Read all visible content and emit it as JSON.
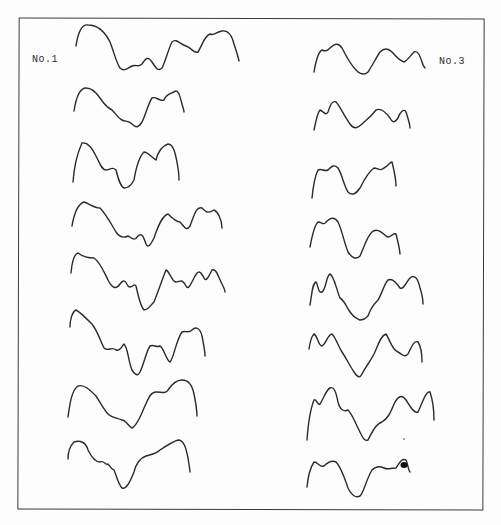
{
  "figure": {
    "columns": [
      {
        "label": "No.1",
        "trace_count": 8
      },
      {
        "label": "No.3",
        "trace_count": 8
      }
    ],
    "stroke_color": "#2b2b2b",
    "background_color": "#fdfdfd",
    "frame_color": "#3a3a3a"
  }
}
